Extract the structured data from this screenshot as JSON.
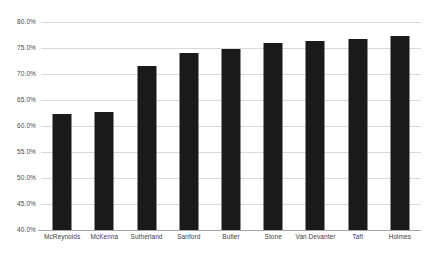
{
  "chart_data": {
    "type": "bar",
    "title": "",
    "xlabel": "",
    "ylabel": "",
    "categories": [
      "McReynolds",
      "McKenna",
      "Sutherland",
      "Sanford",
      "Butler",
      "Stone",
      "Van Devanter",
      "Taft",
      "Holmes"
    ],
    "values": [
      62.4,
      62.6,
      71.5,
      74.0,
      74.9,
      76.0,
      76.4,
      76.7,
      77.3
    ],
    "ylim": [
      40.0,
      80.0
    ],
    "ytick_values": [
      40.0,
      45.0,
      50.0,
      55.0,
      60.0,
      65.0,
      70.0,
      75.0,
      80.0
    ],
    "ytick_labels": [
      "40.0%",
      "45.0%",
      "50.0%",
      "55.0%",
      "60.0%",
      "65.0%",
      "70.0%",
      "75.0%",
      "80.0%"
    ],
    "grid": true,
    "grid_axis": "y",
    "legend": false,
    "legend_position": "none",
    "bar_color": "#1a1a1a",
    "gridline_color": "#d9d9d9",
    "axis_color": "#a6a6a6",
    "background_color": "#ffffff",
    "value_suffix": "%"
  }
}
